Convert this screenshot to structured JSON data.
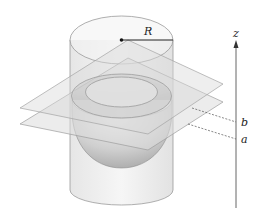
{
  "figure": {
    "type": "3d-geometry-diagram",
    "labels": {
      "radius": "R",
      "axis": "z",
      "upper_plane": "b",
      "lower_plane": "a"
    },
    "colors": {
      "outline": "#8a8a8a",
      "plane_fill": "#d9d9d9",
      "cylinder_fill": "#efefef",
      "hemisphere_fill": "#c8c8c8",
      "axis": "#555555",
      "text": "#222222"
    }
  }
}
